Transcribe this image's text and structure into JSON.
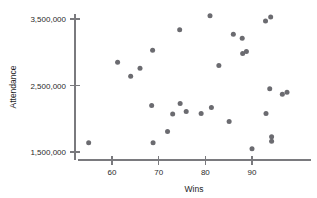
{
  "chart_data": {
    "type": "scatter",
    "title": "",
    "xlabel": "Wins",
    "ylabel": "Attendance",
    "xlim": [
      54,
      99
    ],
    "ylim": [
      1380000,
      3620000
    ],
    "xticks": [
      60,
      70,
      80,
      90
    ],
    "xticklabels": [
      "60",
      "70",
      "80",
      "90"
    ],
    "yticks": [
      1500000,
      2500000,
      3500000
    ],
    "yticklabels": [
      "1,500,000",
      "2,500,000",
      "3,500,000"
    ],
    "grid": false,
    "legend": null,
    "marker_color": "#6b6b70",
    "axis_color": "#7a7a7e",
    "points": [
      {
        "x": 55.0,
        "y": 1640000
      },
      {
        "x": 61.2,
        "y": 2850000
      },
      {
        "x": 64.0,
        "y": 2640000
      },
      {
        "x": 66.0,
        "y": 2760000
      },
      {
        "x": 68.7,
        "y": 3030000
      },
      {
        "x": 68.5,
        "y": 2200000
      },
      {
        "x": 68.8,
        "y": 1640000
      },
      {
        "x": 71.9,
        "y": 1810000
      },
      {
        "x": 73.0,
        "y": 2070000
      },
      {
        "x": 74.5,
        "y": 3340000
      },
      {
        "x": 74.6,
        "y": 2230000
      },
      {
        "x": 75.9,
        "y": 2110000
      },
      {
        "x": 79.1,
        "y": 2080000
      },
      {
        "x": 81.0,
        "y": 3550000
      },
      {
        "x": 81.3,
        "y": 2170000
      },
      {
        "x": 82.9,
        "y": 2800000
      },
      {
        "x": 85.1,
        "y": 1960000
      },
      {
        "x": 86.0,
        "y": 3270000
      },
      {
        "x": 87.9,
        "y": 3210000
      },
      {
        "x": 88.0,
        "y": 2980000
      },
      {
        "x": 88.8,
        "y": 3010000
      },
      {
        "x": 90.0,
        "y": 1550000
      },
      {
        "x": 92.9,
        "y": 3470000
      },
      {
        "x": 93.0,
        "y": 2080000
      },
      {
        "x": 93.8,
        "y": 2450000
      },
      {
        "x": 94.0,
        "y": 3530000
      },
      {
        "x": 94.2,
        "y": 1730000
      },
      {
        "x": 94.2,
        "y": 1660000
      },
      {
        "x": 96.5,
        "y": 2370000
      },
      {
        "x": 97.5,
        "y": 2400000
      }
    ]
  }
}
